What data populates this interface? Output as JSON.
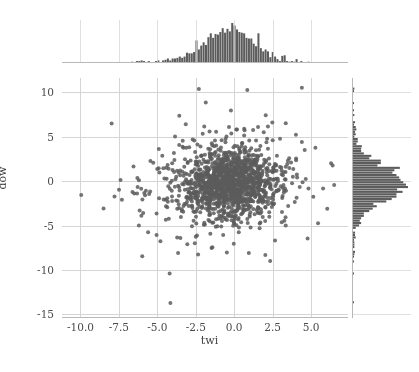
{
  "figure": {
    "width": 419,
    "height": 372,
    "background": "#ffffff",
    "caption_remnant": "",
    "style": "seaborn jointplot"
  },
  "colors": {
    "point": "#5c5c5c",
    "histogram_bar": "#5c5c5c",
    "grid": "#d5d5d5",
    "spine": "#b8b8b8",
    "tick_text": "#4a4a4a",
    "axis_title": "#3d3d3d"
  },
  "axes": {
    "x": {
      "label": "twi",
      "ticks": [
        "-10.0",
        "-7.5",
        "-5.0",
        "-2.5",
        "0.0",
        "2.5",
        "5.0"
      ],
      "tick_values": [
        -10.0,
        -7.5,
        -5.0,
        -2.5,
        0.0,
        2.5,
        5.0
      ],
      "lim": [
        -11.2,
        7.4
      ],
      "grid": true
    },
    "y": {
      "label": "dow",
      "ticks": [
        "10",
        "5",
        "0",
        "-5",
        "-10",
        "-15"
      ],
      "tick_values": [
        10,
        5,
        0,
        -5,
        -10,
        -15
      ],
      "lim": [
        -15.4,
        11.6
      ],
      "grid": true
    }
  },
  "chart_data": {
    "type": "scatter",
    "title": "",
    "subtitle": "",
    "xlabel": "twi",
    "ylabel": "dow",
    "xlim": [
      -11.2,
      7.4
    ],
    "ylim": [
      -15.4,
      11.6
    ],
    "grid": true,
    "legend": null,
    "marker": {
      "shape": "circle",
      "color": "#5c5c5c",
      "size_px": 4.0,
      "alpha": 0.85
    },
    "n_points": 1450,
    "scatter_distribution": {
      "description": "Dense bivariate cloud centered near twi=-0.3, dow=-0.2 with heavy tails; generated deterministically from seeded pseudo-random normal draws.",
      "x_mean": -0.35,
      "x_std": 1.55,
      "y_mean": -0.2,
      "y_std": 1.85,
      "correlation": 0.03,
      "seed": 20240517
    },
    "outliers": [
      {
        "x": -9.95,
        "y": -1.55
      },
      {
        "x": -4.15,
        "y": -13.7
      },
      {
        "x": -4.2,
        "y": -10.4
      },
      {
        "x": -2.3,
        "y": 10.35
      },
      {
        "x": 0.85,
        "y": 10.25
      },
      {
        "x": 4.4,
        "y": 10.5
      },
      {
        "x": -1.85,
        "y": 8.85
      },
      {
        "x": 2.05,
        "y": 7.4
      },
      {
        "x": -3.15,
        "y": 6.4
      },
      {
        "x": -1.95,
        "y": 6.15
      },
      {
        "x": 3.35,
        "y": 6.5
      },
      {
        "x": 1.55,
        "y": 6.1
      },
      {
        "x": 0.65,
        "y": 5.9
      },
      {
        "x": -3.35,
        "y": 4.55
      },
      {
        "x": -5.45,
        "y": 2.25
      },
      {
        "x": -6.55,
        "y": 1.65
      },
      {
        "x": -6.3,
        "y": 0.35
      },
      {
        "x": -6.05,
        "y": -0.85
      },
      {
        "x": -6.5,
        "y": -1.4
      },
      {
        "x": -5.85,
        "y": -1.35
      },
      {
        "x": -6.15,
        "y": -3.3
      },
      {
        "x": -5.05,
        "y": -3.65
      },
      {
        "x": -4.45,
        "y": -4.35
      },
      {
        "x": -6.2,
        "y": -5.0
      },
      {
        "x": -5.6,
        "y": -5.75
      },
      {
        "x": -5.05,
        "y": -6.05
      },
      {
        "x": -3.5,
        "y": -6.4
      },
      {
        "x": -2.5,
        "y": -6.25
      },
      {
        "x": -3.05,
        "y": -7.1
      },
      {
        "x": -3.65,
        "y": -8.1
      },
      {
        "x": -2.35,
        "y": -8.25
      },
      {
        "x": 0.95,
        "y": -8.1
      },
      {
        "x": 3.35,
        "y": -5.0
      },
      {
        "x": 5.45,
        "y": -4.75
      },
      {
        "x": 6.5,
        "y": -0.45
      },
      {
        "x": 6.05,
        "y": -3.1
      },
      {
        "x": 6.4,
        "y": 1.75
      },
      {
        "x": 4.4,
        "y": 4.4
      },
      {
        "x": 6.3,
        "y": 2.0
      }
    ],
    "marginal_x": {
      "type": "histogram",
      "orientation": "vertical",
      "n_bins": 120,
      "peak_at": 0.0,
      "description": "Unimodal right-tailed histogram of twi peaking near 0, spanning roughly -7 to 6."
    },
    "marginal_y": {
      "type": "histogram",
      "orientation": "horizontal",
      "n_bins": 100,
      "peak_at": 0.0,
      "description": "Sharply peaked histogram of dow centered near 0, spanning roughly -6 to 4."
    }
  }
}
